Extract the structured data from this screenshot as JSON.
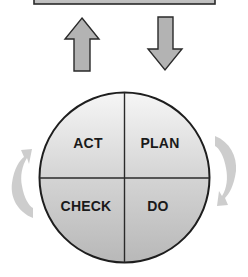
{
  "diagram": {
    "top_box": {
      "label": ""
    },
    "arrows": {
      "up": {
        "direction": "up"
      },
      "down": {
        "direction": "down"
      }
    },
    "cycle": {
      "quadrants": [
        {
          "position": "top-left",
          "label": "ACT"
        },
        {
          "position": "top-right",
          "label": "PLAN"
        },
        {
          "position": "bottom-left",
          "label": "CHECK"
        },
        {
          "position": "bottom-right",
          "label": "DO"
        }
      ],
      "rotation_arrows": [
        {
          "side": "left",
          "direction": "up"
        },
        {
          "side": "right",
          "direction": "down"
        }
      ]
    },
    "colors": {
      "box_fill": "#c4c4c4",
      "arrow_fill": "#b3b3b3",
      "outline": "#2a2a2a",
      "circle_top": "#f4f4f4",
      "circle_bottom": "#bcbcbc",
      "rotation_arrow": "#c8c8c8",
      "text": "#1a1a1a"
    }
  }
}
